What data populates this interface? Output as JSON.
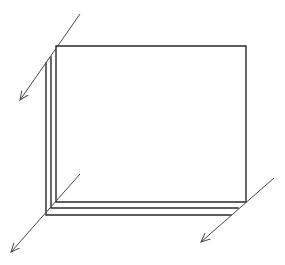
{
  "diagram": {
    "stroke_color": "#2a2a2a",
    "arrow_color": "#4a4a4a",
    "background": "#ffffff",
    "sheets": [
      {
        "name": "back-sheet",
        "left": 56,
        "top": 46,
        "right": 246,
        "bottom": 202
      },
      {
        "name": "middle-sheet",
        "left": 51,
        "top": 57,
        "right": 238,
        "bottom": 208
      },
      {
        "name": "front-sheet",
        "left": 46,
        "top": 63,
        "right": 231,
        "bottom": 215
      }
    ],
    "arrows": [
      {
        "name": "arrow-top-left",
        "from": [
          80,
          14
        ],
        "to": [
          20,
          100
        ]
      },
      {
        "name": "arrow-bottom-left",
        "from": [
          80,
          174
        ],
        "to": [
          11,
          252
        ]
      },
      {
        "name": "arrow-bottom-right",
        "from": [
          274,
          178
        ],
        "to": [
          201,
          242
        ]
      }
    ]
  }
}
